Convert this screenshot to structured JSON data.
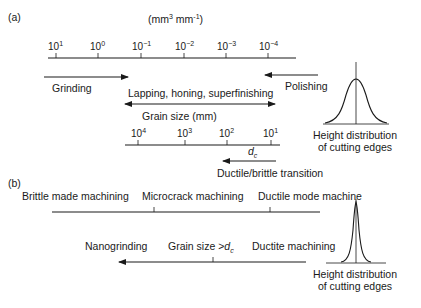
{
  "panel_a": {
    "label": "(a)",
    "units": {
      "base": "(mm",
      "exp1": "3",
      "mid": " mm",
      "exp2": "-1",
      "end": ")"
    },
    "removal_rate_axis": {
      "ticks": [
        {
          "base": "10",
          "exp": "1"
        },
        {
          "base": "10",
          "exp": "0"
        },
        {
          "base": "10",
          "exp": "−1"
        },
        {
          "base": "10",
          "exp": "−2"
        },
        {
          "base": "10",
          "exp": "−3"
        },
        {
          "base": "10",
          "exp": "−4"
        }
      ]
    },
    "processes": {
      "grinding": "Grinding",
      "lapping": "Lapping, honing, superfinishing",
      "polishing": "Polishing"
    },
    "grain_size_title": "Grain size (mm)",
    "grain_size_axis": {
      "ticks": [
        {
          "base": "10",
          "exp": "4"
        },
        {
          "base": "10",
          "exp": "3"
        },
        {
          "base": "10",
          "exp": "2"
        },
        {
          "base": "10",
          "exp": "1"
        }
      ]
    },
    "dc_label": {
      "base": "d",
      "sub": "c"
    },
    "transition_label": "Ductile/brittle transition",
    "distribution_label_line1": "Height distribution",
    "distribution_label_line2": "of cutting edges"
  },
  "panel_b": {
    "label": "(b)",
    "modes": {
      "brittle": "Brittle made machining",
      "microcrack": "Microcrack machining",
      "ductile_mode": "Ductile mode machine"
    },
    "lower": {
      "nanogrinding": "Nanogrinding",
      "grain_size_prefix": "Grain size >",
      "dc_base": "d",
      "dc_sub": "c",
      "ductile_machining": "Ductite machining"
    },
    "distribution_label_line1": "Height distribution",
    "distribution_label_line2": "of cutting edges"
  }
}
